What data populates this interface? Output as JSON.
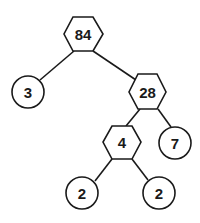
{
  "diagram": {
    "type": "factor-tree",
    "root": "84",
    "nodes": [
      {
        "id": "n84",
        "label": "84",
        "shape": "hexagon",
        "kind": "composite"
      },
      {
        "id": "n3",
        "label": "3",
        "shape": "circle",
        "kind": "prime"
      },
      {
        "id": "n28",
        "label": "28",
        "shape": "hexagon",
        "kind": "composite"
      },
      {
        "id": "n4",
        "label": "4",
        "shape": "hexagon",
        "kind": "composite"
      },
      {
        "id": "n7",
        "label": "7",
        "shape": "circle",
        "kind": "prime"
      },
      {
        "id": "n2a",
        "label": "2",
        "shape": "circle",
        "kind": "prime"
      },
      {
        "id": "n2b",
        "label": "2",
        "shape": "circle",
        "kind": "prime"
      }
    ],
    "edges": [
      {
        "from": "84",
        "to": "3"
      },
      {
        "from": "84",
        "to": "28"
      },
      {
        "from": "28",
        "to": "4"
      },
      {
        "from": "28",
        "to": "7"
      },
      {
        "from": "4",
        "to": "2"
      },
      {
        "from": "4",
        "to": "2"
      }
    ],
    "legend": {
      "hexagon": "composite number",
      "circle": "prime number"
    }
  }
}
